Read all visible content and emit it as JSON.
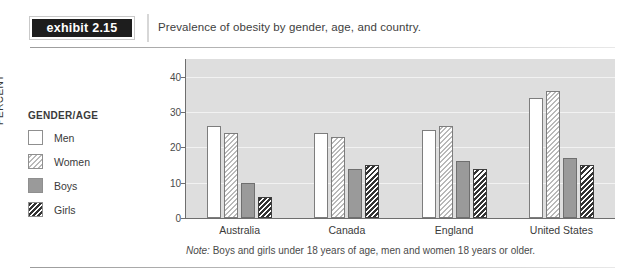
{
  "header": {
    "badge_word": "exhibit",
    "badge_number": "2.15",
    "title": "Prevalence of obesity by gender, age, and country."
  },
  "legend": {
    "title": "GENDER/AGE",
    "items": [
      {
        "label": "Men",
        "swatch": "men-swatch",
        "color": "#ffffff"
      },
      {
        "label": "Women",
        "swatch": "women-swatch",
        "color": "#b9b9b9"
      },
      {
        "label": "Boys",
        "swatch": "boys-swatch",
        "color": "#9a9a9a"
      },
      {
        "label": "Girls",
        "swatch": "girls-swatch",
        "color": "#333333"
      }
    ]
  },
  "note": {
    "lead": "Note:",
    "text": " Boys and girls under 18 years of age, men and women 18 years or older."
  },
  "chart_data": {
    "type": "bar",
    "title": "Prevalence of obesity by gender, age, and country.",
    "xlabel": "",
    "ylabel": "PERCENT",
    "ylim": [
      0,
      45
    ],
    "yticks": [
      0,
      10,
      20,
      30,
      40
    ],
    "ytick_labels": [
      "0",
      "10",
      "20",
      "30",
      "40"
    ],
    "grid": true,
    "legend_position": "left",
    "categories": [
      "Australia",
      "Canada",
      "England",
      "United States"
    ],
    "series": [
      {
        "name": "Men",
        "values": [
          26,
          24,
          25,
          34
        ]
      },
      {
        "name": "Women",
        "values": [
          24,
          23,
          26,
          36
        ]
      },
      {
        "name": "Boys",
        "values": [
          10,
          14,
          16,
          17
        ]
      },
      {
        "name": "Girls",
        "values": [
          6,
          15,
          14,
          15
        ]
      }
    ]
  }
}
